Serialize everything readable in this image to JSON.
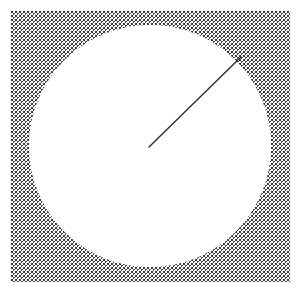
{
  "widget": {
    "name": "analog-gauge",
    "title": "",
    "width": 302,
    "height": 294,
    "background_color": "#ffffff"
  },
  "frame": {
    "name": "stippled-frame",
    "x": 10,
    "y": 10,
    "width": 281,
    "height": 273,
    "border_color": "#f2f2f2",
    "stipple_color": "#3a3a3a",
    "stipple_spacing_px": 4,
    "stipple_dot_size_px": 2
  },
  "face": {
    "name": "gauge-face",
    "shape": "circle",
    "center_x": 150,
    "center_y": 146,
    "radius": 122,
    "fill_color": "#ffffff"
  },
  "needle": {
    "name": "gauge-needle",
    "pivot_x": 149,
    "pivot_y": 147,
    "tip_x": 241,
    "tip_y": 57,
    "length": 129,
    "angle_degrees": 44,
    "stroke_color": "#2b2b33",
    "stroke_width": 1.4,
    "value_label": ""
  },
  "chart_data": {
    "type": "gauge",
    "title": "",
    "value_angle_deg": 44,
    "needle_vector": {
      "dx": 92,
      "dy": -90
    },
    "center": [
      150,
      146
    ],
    "radius": 122,
    "series": [
      {
        "name": "needle",
        "values": [
          44
        ]
      }
    ]
  }
}
